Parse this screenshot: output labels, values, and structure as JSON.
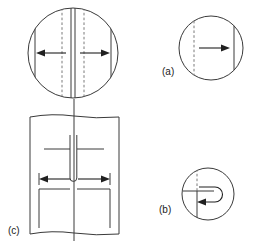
{
  "figure": {
    "background_color": "#ffffff",
    "line_color": "#3a3a3a",
    "dashed_line_color": "#7a7a7a",
    "arrow_color": "#202020",
    "width": 255,
    "height": 244
  },
  "panels": [
    {
      "id": "main",
      "label": "",
      "type": "circular-view",
      "description": "Large circle with central pair of solid vertical lines, two flanking dashed vertical lines, two solid chords near left and right edges, and a double-headed outward arrow pair",
      "arrows": [
        "left",
        "right"
      ],
      "center_x": 73,
      "center_y": 53,
      "radius": 45
    },
    {
      "id": "a",
      "label": "(a)",
      "type": "circular-view",
      "description": "Circle with a dashed vertical line at left, a solid vertical line at right, and a single arrow pointing right",
      "arrows": [
        "right"
      ],
      "center_x": 211,
      "center_y": 48,
      "radius": 32
    },
    {
      "id": "b",
      "label": "(b)",
      "type": "circular-view",
      "description": "Circle with a vertical line (dashed above, solid below), a horizontal line, and a hooked U-turn arrow pointing back to the left",
      "arrows": [
        "hook-left"
      ],
      "center_x": 208,
      "center_y": 194,
      "radius": 26
    },
    {
      "id": "c",
      "label": "(c)",
      "type": "cross-section",
      "description": "Rectangular cross-section with wavy break lines top and bottom, central U-shaped narrow channel, inner shelf lines, and a double-headed horizontal arrow",
      "arrows": [
        "left",
        "right"
      ],
      "x": 30,
      "y": 113,
      "width": 89,
      "height": 125
    }
  ],
  "labels": {
    "a": "(a)",
    "b": "(b)",
    "c": "(c)"
  }
}
